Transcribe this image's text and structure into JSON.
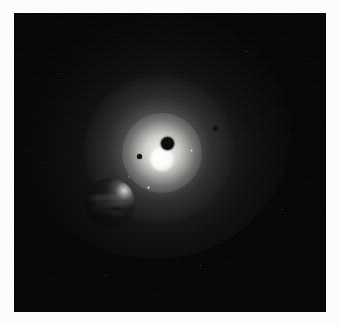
{
  "image": {
    "title": "Bright star with transiting dark body and foreground crescent planet",
    "medium": "astronomical photograph",
    "frame_color": "#fcfcfc",
    "plate_color": "#010101"
  },
  "scene": {
    "label": "deep-space scene",
    "objects": [
      {
        "name": "central-star",
        "label": "Central star",
        "center_x": 148,
        "center_y": 146,
        "radius": 12,
        "color": "#ffffff",
        "description": "Overexposed stellar photosphere with broad diffuse corona"
      },
      {
        "name": "transit-body",
        "label": "Dark transiting body",
        "center_x": 153,
        "center_y": 130,
        "radius": 6,
        "color": "#060607",
        "description": "Silhouetted disc crossing the upper-right of the stellar disc"
      },
      {
        "name": "crescent-planet",
        "label": "Foreground crescent planet",
        "center_x": 96,
        "center_y": 190,
        "radius": 25,
        "color": "#0b0b0c",
        "limb_color": "#fffffc",
        "description": "Large night-side planet lit by a thin bright crescent along its upper-right limb, faint cloud mottling visible"
      },
      {
        "name": "speck-left-dark",
        "label": "Dark speck left of star",
        "center_x": 125,
        "center_y": 143,
        "radius": 2,
        "color": "#0b0b0c"
      },
      {
        "name": "speck-right-dark",
        "label": "Dark speck upper right",
        "center_x": 201,
        "center_y": 115,
        "radius": 2,
        "color": "#0c0c0d"
      },
      {
        "name": "speck-bright-lower",
        "label": "Bright speck below star",
        "center_x": 134,
        "center_y": 174,
        "radius": 1,
        "color": "#e8e8e4"
      },
      {
        "name": "speck-bright-right",
        "label": "Bright speck right of star",
        "center_x": 177,
        "center_y": 137,
        "radius": 1,
        "color": "#dcdcd8"
      },
      {
        "name": "speck-faint-lowleft",
        "label": "Faint speck lower left of star",
        "center_x": 115,
        "center_y": 164,
        "radius": 1,
        "color": "#b9b9b6"
      }
    ],
    "corona": {
      "label": "Diffuse corona",
      "inner_color": "#fcfcfa",
      "mid_color": "#b9b9b7",
      "outer_color": "#2f2f31"
    },
    "background": {
      "label": "Star field",
      "color": "#010101",
      "grain": "fine photographic grain"
    }
  }
}
